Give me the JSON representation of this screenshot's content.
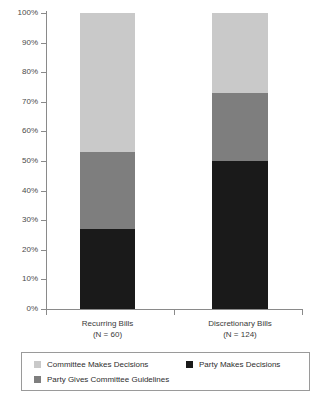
{
  "chart_data": {
    "type": "bar",
    "subtype": "stacked-100-percent",
    "title": "",
    "subtitle": "",
    "xlabel": "",
    "ylabel": "",
    "ylim": [
      0,
      100
    ],
    "grid": false,
    "legend_position": "bottom",
    "categories": [
      "Recurring Bills",
      "Discretionary Bills"
    ],
    "category_sublabels": [
      "(N = 60)",
      "(N = 124)"
    ],
    "sample_sizes": [
      60,
      124
    ],
    "y_tick_labels": [
      "0%",
      "10%",
      "20%",
      "30%",
      "40%",
      "50%",
      "60%",
      "70%",
      "80%",
      "90%",
      "100%"
    ],
    "y_tick_values": [
      0,
      10,
      20,
      30,
      40,
      50,
      60,
      70,
      80,
      90,
      100
    ],
    "series": [
      {
        "name": "Party Makes Decisions",
        "color": "#1a1a1a",
        "values": [
          27,
          50
        ]
      },
      {
        "name": "Party Gives Committee Guidelines",
        "color": "#7e7e7e",
        "values": [
          26,
          23
        ]
      },
      {
        "name": "Committee Makes Decisions",
        "color": "#c9c9c9",
        "values": [
          47,
          27
        ]
      }
    ],
    "legend_entries": [
      {
        "label": "Committee Makes Decisions",
        "color": "#c9c9c9"
      },
      {
        "label": "Party Makes Decisions",
        "color": "#1a1a1a"
      },
      {
        "label": "Party Gives Committee Guidelines",
        "color": "#7e7e7e"
      }
    ],
    "colors": {
      "axis": "#8a8a8a",
      "tick_label": "#4a4a4a",
      "legend_border": "#9a9a9a",
      "background": "#ffffff"
    }
  }
}
